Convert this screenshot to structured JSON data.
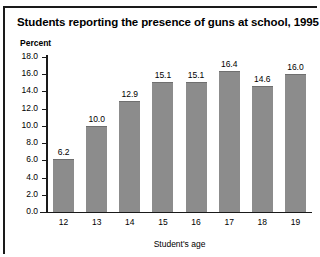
{
  "chart_data": {
    "type": "bar",
    "title": "Students reporting the presence of guns at school, 1995",
    "xlabel": "Student's age",
    "ylabel": "Percent",
    "categories": [
      "12",
      "13",
      "14",
      "15",
      "16",
      "17",
      "18",
      "19"
    ],
    "values": [
      6.2,
      10.0,
      12.9,
      15.1,
      15.1,
      16.4,
      14.6,
      16.0
    ],
    "value_labels": [
      "6.2",
      "10.0",
      "12.9",
      "15.1",
      "15.1",
      "16.4",
      "14.6",
      "16.0"
    ],
    "ylim": [
      0.0,
      18.0
    ],
    "ytick_labels": [
      "0.0",
      "2.0",
      "4.0",
      "6.0",
      "8.0",
      "10.0",
      "12.0",
      "14.0",
      "16.0",
      "18.0"
    ],
    "ytick_values": [
      0.0,
      2.0,
      4.0,
      6.0,
      8.0,
      10.0,
      12.0,
      14.0,
      16.0,
      18.0
    ],
    "grid": false,
    "legend": null,
    "bar_color": "#8c8c8c",
    "axis_color": "#1a1a1a",
    "background": "#ffffff"
  }
}
